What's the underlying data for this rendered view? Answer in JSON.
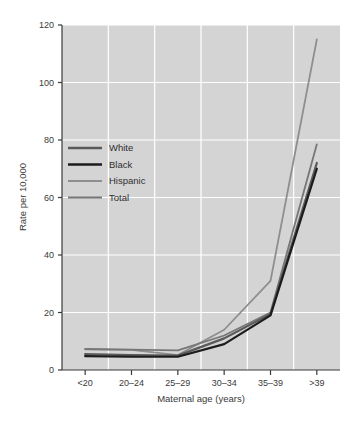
{
  "chart_data": {
    "type": "line",
    "title": "",
    "xlabel": "Maternal age (years)",
    "ylabel": "Rate per 10,000",
    "categories": [
      "<20",
      "20–24",
      "25–29",
      "30–34",
      "35–39",
      ">39"
    ],
    "ylim": [
      0,
      120
    ],
    "yticks": [
      0,
      20,
      40,
      60,
      80,
      100,
      120
    ],
    "ytick_labels": [
      "0",
      "20",
      "40",
      "60",
      "80",
      "100",
      "120"
    ],
    "grid": true,
    "grid_color": "#ffffff",
    "plot_background": "#d4d4d4",
    "legend_position": "upper left",
    "series": [
      {
        "name": "White",
        "color": "#5a5a5a",
        "width": 2.2,
        "values": [
          5.5,
          5.2,
          5.0,
          11.0,
          19.5,
          72.0
        ]
      },
      {
        "name": "Black",
        "color": "#1c1c1c",
        "width": 2.2,
        "values": [
          4.8,
          4.6,
          4.6,
          9.0,
          19.0,
          70.0
        ]
      },
      {
        "name": "Hispanic",
        "color": "#8e8e8e",
        "width": 1.8,
        "values": [
          7.2,
          7.0,
          5.2,
          14.0,
          31.0,
          115.0
        ]
      },
      {
        "name": "Total",
        "color": "#777777",
        "width": 1.8,
        "values": [
          7.3,
          7.1,
          6.8,
          12.0,
          20.0,
          78.5
        ]
      }
    ]
  },
  "legend": {
    "items": [
      {
        "label": "White"
      },
      {
        "label": "Black"
      },
      {
        "label": "Hispanic"
      },
      {
        "label": "Total"
      }
    ]
  }
}
